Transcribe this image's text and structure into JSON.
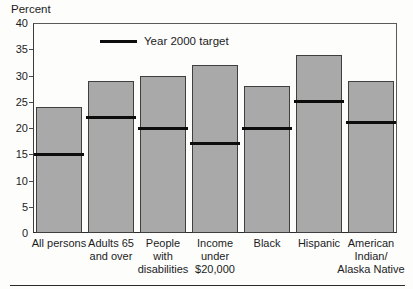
{
  "chart_data": {
    "type": "bar",
    "title": "",
    "xlabel": "",
    "ylabel": "Percent",
    "ylim": [
      0,
      40
    ],
    "ytick_step": 5,
    "grid": false,
    "categories": [
      "All persons",
      "Adults 65 and over",
      "People with disabilities",
      "Income under $20,000",
      "Black",
      "Hispanic",
      "American Indian/Alaska Native"
    ],
    "category_label_lines": [
      [
        "All persons"
      ],
      [
        "Adults 65",
        "and over"
      ],
      [
        "People",
        "with",
        "disabilities"
      ],
      [
        "Income",
        "under",
        "$20,000"
      ],
      [
        "Black"
      ],
      [
        "Hispanic"
      ],
      [
        "American",
        "Indian/",
        "Alaska Native"
      ]
    ],
    "series": [
      {
        "name": "Prevalence (bar)",
        "values": [
          24,
          29,
          30,
          32,
          28,
          34,
          29
        ]
      },
      {
        "name": "Year 2000 target",
        "values": [
          15,
          22,
          20,
          17,
          20,
          25,
          21
        ]
      }
    ],
    "legend": {
      "label": "Year 2000 target",
      "position": "top-center",
      "swatch": "black-line"
    },
    "colors": {
      "bar_fill": "#a9a9a9",
      "bar_border": "#3f3f3f",
      "target_line": "#0d0d0d",
      "text": "#1c1c1c",
      "background": "#fdfdfc"
    }
  }
}
